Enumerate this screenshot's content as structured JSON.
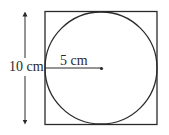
{
  "diagram": {
    "type": "circle inscribed in square",
    "labels": {
      "side": "10 cm",
      "radius": "5 cm"
    },
    "colors": {
      "stroke": "#2a2a2a",
      "background": "#ffffff"
    }
  }
}
